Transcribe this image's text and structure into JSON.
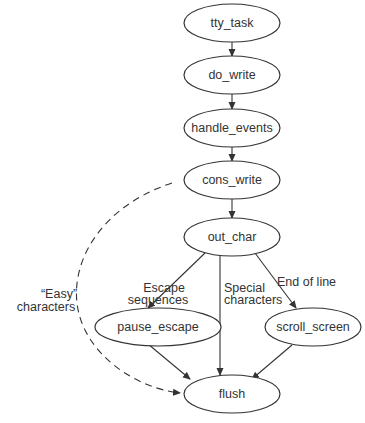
{
  "diagram": {
    "nodes": [
      {
        "id": "tty_task",
        "label": "tty_task"
      },
      {
        "id": "do_write",
        "label": "do_write"
      },
      {
        "id": "handle_events",
        "label": "handle_events"
      },
      {
        "id": "cons_write",
        "label": "cons_write"
      },
      {
        "id": "out_char",
        "label": "out_char"
      },
      {
        "id": "pause_escape",
        "label": "pause_escape"
      },
      {
        "id": "scroll_screen",
        "label": "scroll_screen"
      },
      {
        "id": "flush",
        "label": "flush"
      }
    ],
    "edges": [
      {
        "from": "tty_task",
        "to": "do_write",
        "label": ""
      },
      {
        "from": "do_write",
        "to": "handle_events",
        "label": ""
      },
      {
        "from": "handle_events",
        "to": "cons_write",
        "label": ""
      },
      {
        "from": "cons_write",
        "to": "out_char",
        "label": ""
      },
      {
        "from": "out_char",
        "to": "pause_escape",
        "label": "Escape sequences"
      },
      {
        "from": "out_char",
        "to": "flush",
        "label": "Special characters"
      },
      {
        "from": "out_char",
        "to": "scroll_screen",
        "label": "End of line"
      },
      {
        "from": "pause_escape",
        "to": "flush",
        "label": ""
      },
      {
        "from": "scroll_screen",
        "to": "flush",
        "label": ""
      },
      {
        "from": "cons_write",
        "to": "flush",
        "label": "\"Easy\" characters",
        "style": "dashed"
      }
    ],
    "edge_labels": {
      "escape_line1": "Escape",
      "escape_line2": "sequences",
      "special_line1": "Special",
      "special_line2": "characters",
      "end_of_line": "End of line",
      "easy_line1": "“Easy”",
      "easy_line2": "characters"
    },
    "colors": {
      "stroke": "#333333",
      "background": "#ffffff"
    }
  }
}
